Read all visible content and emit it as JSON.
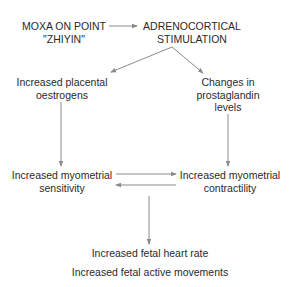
{
  "diagram": {
    "type": "flowchart",
    "colors": {
      "text": "#2a2a2a",
      "arrow": "#8a8a8a",
      "background": "#ffffff"
    },
    "nodes": {
      "moxa": {
        "line1": "MOXA ON POINT",
        "line2": "\"ZHIYIN\""
      },
      "adrenocortical": {
        "line1": "ADRENOCORTICAL",
        "line2": "STIMULATION"
      },
      "oestrogens": {
        "line1": "Increased placental",
        "line2": "oestrogens"
      },
      "prostaglandin": {
        "line1": "Changes in",
        "line2": "prostaglandin",
        "line3": "levels"
      },
      "sensitivity": {
        "line1": "Increased myometrial",
        "line2": "sensitivity"
      },
      "contractility": {
        "line1": "Increased myometrial",
        "line2": "contractility"
      },
      "heart_rate": {
        "line1": "Increased fetal heart rate"
      },
      "movements": {
        "line1": "Increased fetal active movements"
      }
    },
    "edges": [
      {
        "from": "moxa",
        "to": "adrenocortical"
      },
      {
        "from": "adrenocortical",
        "to": "oestrogens"
      },
      {
        "from": "adrenocortical",
        "to": "prostaglandin"
      },
      {
        "from": "oestrogens",
        "to": "sensitivity"
      },
      {
        "from": "prostaglandin",
        "to": "contractility"
      },
      {
        "from": "sensitivity",
        "to": "contractility"
      },
      {
        "from": "contractility",
        "to": "sensitivity"
      },
      {
        "from": "sensitivity-contractility",
        "to": "heart_rate"
      }
    ]
  }
}
